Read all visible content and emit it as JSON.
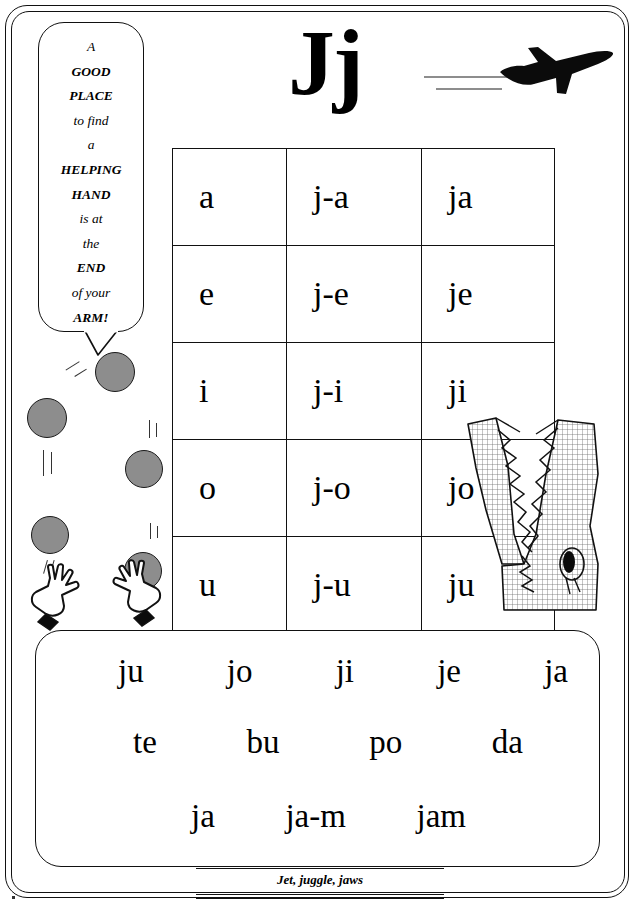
{
  "page": {
    "title": "Jj",
    "footer_caption": "Jet, juggle, jaws"
  },
  "speech_bubble": {
    "lines": [
      "A",
      "GOOD",
      "PLACE",
      "to find",
      "a",
      "HELPING",
      "HAND",
      "is at",
      "the",
      "END",
      "of your",
      "ARM!"
    ]
  },
  "syllable_table": {
    "rows": [
      {
        "vowel": "a",
        "split": "j-a",
        "blend": "ja"
      },
      {
        "vowel": "e",
        "split": "j-e",
        "blend": "je"
      },
      {
        "vowel": "i",
        "split": "j-i",
        "blend": "ji"
      },
      {
        "vowel": "o",
        "split": "j-o",
        "blend": "jo"
      },
      {
        "vowel": "u",
        "split": "j-u",
        "blend": "ju"
      }
    ]
  },
  "practice_box": {
    "row1": [
      "ju",
      "jo",
      "ji",
      "je",
      "ja"
    ],
    "row2": [
      "te",
      "bu",
      "po",
      "da"
    ],
    "row3": [
      "ja",
      "ja-m",
      "jam"
    ]
  },
  "illustrations": {
    "jet": "jet-plane-icon",
    "crocodile": "crocodile-head-icon",
    "hand_left": "juggling-hand-icon",
    "hand_right": "juggling-hand-icon",
    "balls": [
      {
        "x": 95,
        "y": 352,
        "size": 40
      },
      {
        "x": 27,
        "y": 398,
        "size": 40
      },
      {
        "x": 125,
        "y": 450,
        "size": 38
      },
      {
        "x": 31,
        "y": 516,
        "size": 38
      },
      {
        "x": 124,
        "y": 552,
        "size": 38
      }
    ]
  },
  "colors": {
    "ink": "#111111",
    "ball_fill": "#8d8d8d",
    "contrail": "#8d8d8d",
    "paper": "#ffffff"
  }
}
